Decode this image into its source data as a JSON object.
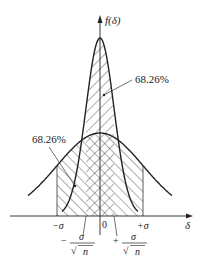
{
  "figure": {
    "type": "normal distribution comparison diagram",
    "y_axis_label": "f(δ)",
    "x_axis_label": "δ",
    "origin_label": "0",
    "annotations": [
      {
        "id": "narrow",
        "text": "68.26%",
        "refers_to": "area under narrow curve within ±σ/√n"
      },
      {
        "id": "wide",
        "text": "68.26%",
        "refers_to": "area under wide curve within ±σ"
      }
    ],
    "tick_labels": {
      "minus_sigma": "−σ",
      "plus_sigma": "+σ",
      "minus_sigma_n_sign": "−",
      "plus_sigma_n_sign": "+",
      "sigma": "σ",
      "sqrt_n": "√ n",
      "n": "n"
    },
    "curves": [
      {
        "name": "single measurement distribution",
        "std": "σ",
        "shading": "single hatch within ±σ"
      },
      {
        "name": "mean distribution",
        "std": "σ/√n",
        "shading": "single hatch within ±σ/√n, cross-hatched overlap"
      }
    ],
    "colors": {
      "line": "#222222",
      "hatch": "#333333",
      "background": "#ffffff"
    }
  }
}
